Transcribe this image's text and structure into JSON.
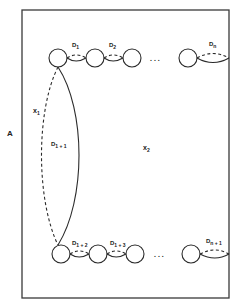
{
  "figure": {
    "outer_label": "A",
    "region_labels": {
      "x1": {
        "base": "x",
        "sub": "1"
      },
      "x2": {
        "base": "x",
        "sub": "2"
      }
    },
    "top_row": {
      "edges": [
        {
          "base": "D",
          "sub": "1"
        },
        {
          "base": "D",
          "sub": "2"
        },
        {
          "base": "D",
          "sub": "n"
        }
      ],
      "ellipsis": ". . ."
    },
    "connector": {
      "base": "D",
      "sub": "1 + 1"
    },
    "bottom_row": {
      "edges": [
        {
          "base": "D",
          "sub": "1 + 2"
        },
        {
          "base": "D",
          "sub": "1 + 3"
        },
        {
          "base": "D",
          "sub": "n + 1"
        }
      ],
      "ellipsis": ". . ."
    }
  }
}
